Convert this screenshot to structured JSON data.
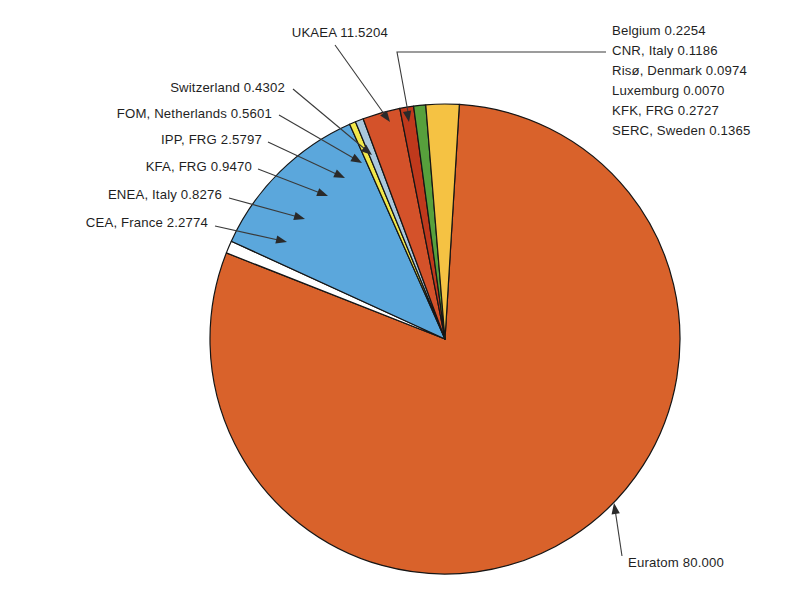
{
  "figure": {
    "background_color": "#ffffff",
    "pie": {
      "center_x": 445,
      "center_y": 339,
      "radius": 235,
      "start_angle_deg": -86.5,
      "outline_color": "#151515"
    }
  },
  "chart_data": {
    "type": "pie",
    "title": "",
    "subtitle": "",
    "xlabel": "",
    "ylabel": "",
    "legend_position": "none",
    "grid": false,
    "units": "percent of contributions",
    "total": 100.0,
    "categories": [
      "Euratom",
      "Belgium",
      "CNR, Italy",
      "Risø, Denmark",
      "Luxemburg",
      "KFK, FRG",
      "SERC, Sweden",
      "UKAEA",
      "Switzerland",
      "FOM, Netherlands",
      "IPP, FRG",
      "KFA, FRG",
      "ENEA, Italy",
      "CEA, France"
    ],
    "values": [
      80.0,
      0.2254,
      0.1186,
      0.0974,
      0.007,
      0.2727,
      0.1365,
      11.5204,
      0.4302,
      0.5601,
      2.5797,
      0.947,
      0.8276,
      2.2774
    ],
    "labels": [
      "Euratom 80.000",
      "Belgium 0.2254",
      "CNR, Italy 0.1186",
      "Risø, Denmark 0.0974",
      "Luxemburg 0.0070",
      "KFK, FRG 0.2727",
      "SERC, Sweden 0.1365",
      "UKAEA 11.5204",
      "Switzerland 0.4302",
      "FOM, Netherlands 0.5601",
      "IPP, FRG 2.5797",
      "KFA, FRG 0.9470",
      "ENEA, Italy 0.8276",
      "CEA, France 2.2774"
    ],
    "colors": [
      "#d9622b",
      "#ffffff",
      "#ffffff",
      "#ffffff",
      "#ffffff",
      "#ffffff",
      "#ffffff",
      "#5ba7dc",
      "#f2e84a",
      "#aac8dd",
      "#d4522a",
      "#c0391c",
      "#57a03c",
      "#f5c243"
    ]
  },
  "slices": [
    {
      "name": "euratom",
      "label": "Euratom 80.000",
      "value": 80.0,
      "color": "#d9622b"
    },
    {
      "name": "small-group",
      "label": "",
      "value": 0.8576,
      "color": "#ffffff"
    },
    {
      "name": "ukaea",
      "label": "UKAEA 11.5204",
      "value": 11.5204,
      "color": "#5ba7dc"
    },
    {
      "name": "switzerland",
      "label": "Switzerland 0.4302",
      "value": 0.4302,
      "color": "#f2e84a"
    },
    {
      "name": "fom-netherlands",
      "label": "FOM, Netherlands 0.5601",
      "value": 0.5601,
      "color": "#aac8dd"
    },
    {
      "name": "ipp-frg",
      "label": "IPP, FRG 2.5797",
      "value": 2.5797,
      "color": "#d4522a"
    },
    {
      "name": "kfa-frg",
      "label": "KFA, FRG 0.9470",
      "value": 0.947,
      "color": "#c0391c"
    },
    {
      "name": "enea-italy",
      "label": "ENEA, Italy 0.8276",
      "value": 0.8276,
      "color": "#57a03c"
    },
    {
      "name": "cea-france",
      "label": "CEA, France 2.2774",
      "value": 2.2774,
      "color": "#f5c243"
    }
  ],
  "labels_left": [
    {
      "name": "label-ukaea",
      "text": "UKAEA 11.5204",
      "x": 388,
      "y": 37,
      "anchor": "end",
      "leader": [
        [
          335,
          45
        ],
        [
          390,
          122
        ]
      ],
      "arrow_angle_deg": 54
    },
    {
      "name": "label-switzerland",
      "text": "Switzerland 0.4302",
      "x": 285,
      "y": 92,
      "anchor": "end",
      "leader": [
        [
          293,
          89
        ],
        [
          372,
          155
        ]
      ],
      "arrow_angle_deg": 40
    },
    {
      "name": "label-fom-netherlands",
      "text": "FOM, Netherlands 0.5601",
      "x": 272,
      "y": 118,
      "anchor": "end",
      "leader": [
        [
          279,
          115
        ],
        [
          362,
          163
        ]
      ],
      "arrow_angle_deg": 30
    },
    {
      "name": "label-ipp-frg",
      "text": "IPP, FRG 2.5797",
      "x": 262,
      "y": 144,
      "anchor": "end",
      "leader": [
        [
          268,
          142
        ],
        [
          345,
          178
        ]
      ],
      "arrow_angle_deg": 25
    },
    {
      "name": "label-kfa-frg",
      "text": "KFA, FRG 0.9470",
      "x": 252,
      "y": 171,
      "anchor": "end",
      "leader": [
        [
          258,
          169
        ],
        [
          328,
          196
        ]
      ],
      "arrow_angle_deg": 21
    },
    {
      "name": "label-enea-italy",
      "text": "ENEA, Italy 0.8276",
      "x": 222,
      "y": 199,
      "anchor": "end",
      "leader": [
        [
          229,
          198
        ],
        [
          305,
          219
        ]
      ],
      "arrow_angle_deg": 16
    },
    {
      "name": "label-cea-france",
      "text": "CEA, France 2.2774",
      "x": 208,
      "y": 227,
      "anchor": "end",
      "leader": [
        [
          215,
          226
        ],
        [
          287,
          242
        ]
      ],
      "arrow_angle_deg": 13
    }
  ],
  "labels_right": [
    {
      "name": "label-belgium",
      "text": "Belgium 0.2254",
      "x": 612,
      "y": 35
    },
    {
      "name": "label-cnr-italy",
      "text": "CNR, Italy 0.1186",
      "x": 612,
      "y": 55
    },
    {
      "name": "label-riso-denmark",
      "text": "Risø, Denmark 0.0974",
      "x": 612,
      "y": 75
    },
    {
      "name": "label-luxemburg",
      "text": "Luxemburg 0.0070",
      "x": 612,
      "y": 95
    },
    {
      "name": "label-kfk-frg",
      "text": "KFK, FRG 0.2727",
      "x": 612,
      "y": 115
    },
    {
      "name": "label-serc-sweden",
      "text": "SERC, Sweden 0.1365",
      "x": 612,
      "y": 135
    }
  ],
  "bracket_right": {
    "name": "bracket-small-slices",
    "path": "M 606 52 L 397 52 L 408 112",
    "arrow_tip": [
      409,
      122
    ],
    "arrow_angle_deg": 80
  },
  "label_euratom": {
    "name": "label-euratom",
    "text": "Euratom 80.000",
    "x": 628,
    "y": 567,
    "anchor": "start",
    "leader": [
      [
        622,
        556
      ],
      [
        614,
        503
      ]
    ],
    "arrow_angle_deg": -99
  }
}
